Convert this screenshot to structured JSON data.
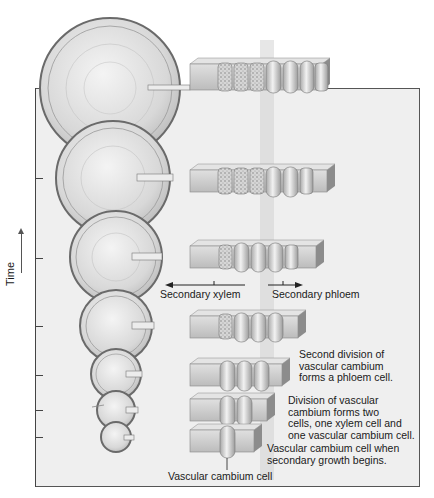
{
  "diagram": {
    "axis": {
      "label": "Time",
      "arrow": "up-arrow-icon"
    },
    "stems": [
      {
        "cx": 110,
        "cy": 88,
        "r": 70
      },
      {
        "cx": 113,
        "cy": 178,
        "r": 57
      },
      {
        "cx": 116,
        "cy": 257,
        "r": 46
      },
      {
        "cx": 116,
        "cy": 326,
        "r": 36
      },
      {
        "cx": 116,
        "cy": 374,
        "r": 25
      },
      {
        "cx": 116,
        "cy": 410,
        "r": 19
      },
      {
        "cx": 116,
        "cy": 437,
        "r": 15
      }
    ],
    "cell_rows": [
      {
        "y": 72,
        "cells": [
          "xylem",
          "xylem",
          "xylem",
          "cambium",
          "cambium",
          "phloem",
          "phloem"
        ]
      },
      {
        "y": 163,
        "cells": [
          "xylem",
          "xylem",
          "xylem",
          "cambium",
          "cambium",
          "phloem"
        ]
      },
      {
        "y": 243,
        "cells": [
          "xylem",
          "cambium",
          "cambium",
          "cambium",
          "phloem"
        ]
      },
      {
        "y": 312,
        "cells": [
          "xylem",
          "cambium",
          "cambium",
          "cambium"
        ]
      },
      {
        "y": 359,
        "cells": [
          "cambium",
          "cambium",
          "cambium"
        ]
      },
      {
        "y": 394,
        "cells": [
          "cambium",
          "cambium"
        ]
      },
      {
        "y": 427,
        "cells": [
          "cambium"
        ]
      }
    ],
    "labels": {
      "secondary_xylem": "Secondary xylem",
      "secondary_phloem": "Secondary phloem",
      "second_division": [
        "Second division of",
        "vascular cambium",
        "forms a phloem cell."
      ],
      "first_division": [
        "Division of vascular",
        "cambium forms two",
        "cells, one xylem cell and",
        "one vascular cambium cell."
      ],
      "initial_cell": [
        "Vascular cambium cell when",
        "secondary growth begins."
      ],
      "vascular_cambium_cell": "Vascular cambium cell"
    },
    "colors": {
      "panel": "#efefef",
      "stem_fill": "#d9d9d9",
      "stem_edge": "#6a6a6a",
      "block": "#cfcfcf",
      "cell": "#e2e2e2"
    }
  }
}
